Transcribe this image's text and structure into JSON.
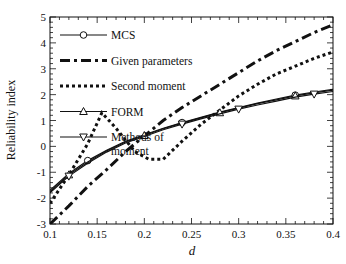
{
  "chart_data": {
    "type": "line",
    "title": "",
    "xlabel": "d",
    "ylabel": "Reliability index",
    "xlim": [
      0.1,
      0.4
    ],
    "ylim": [
      -3,
      5
    ],
    "xticks": [
      0.1,
      0.15,
      0.2,
      0.25,
      0.3,
      0.35,
      0.4
    ],
    "xtick_labels": [
      "0.1",
      "0.15",
      "0.2",
      "0.25",
      "0.3",
      "0.35",
      "0.4"
    ],
    "yticks": [
      -3,
      -2,
      -1,
      0,
      1,
      2,
      3,
      4,
      5
    ],
    "ytick_labels": [
      "-3",
      "-2",
      "-1",
      "0",
      "1",
      "2",
      "3",
      "4",
      "5"
    ],
    "grid": false,
    "legend_position": "top-left",
    "series": [
      {
        "name": "MCS",
        "style": "solid",
        "marker": "circle",
        "x": [
          0.1,
          0.12,
          0.14,
          0.16,
          0.18,
          0.2,
          0.22,
          0.24,
          0.26,
          0.28,
          0.3,
          0.32,
          0.34,
          0.36,
          0.38,
          0.4
        ],
        "y": [
          -1.7,
          -1.05,
          -0.55,
          -0.15,
          0.2,
          0.45,
          0.7,
          0.92,
          1.12,
          1.32,
          1.5,
          1.67,
          1.83,
          1.98,
          2.1,
          2.2
        ],
        "marker_x": [
          0.14,
          0.24,
          0.36
        ]
      },
      {
        "name": "Given parameters",
        "style": "dashdot",
        "marker": "none",
        "x": [
          0.1,
          0.12,
          0.14,
          0.16,
          0.18,
          0.2,
          0.22,
          0.24,
          0.26,
          0.28,
          0.3,
          0.32,
          0.34,
          0.36,
          0.38,
          0.4
        ],
        "y": [
          -3.0,
          -2.3,
          -1.55,
          -0.9,
          -0.2,
          0.4,
          1.0,
          1.5,
          1.95,
          2.4,
          2.85,
          3.3,
          3.7,
          4.05,
          4.4,
          4.7
        ]
      },
      {
        "name": "Second moment",
        "style": "dotted",
        "marker": "none",
        "x": [
          0.1,
          0.12,
          0.14,
          0.155,
          0.17,
          0.19,
          0.205,
          0.22,
          0.24,
          0.26,
          0.28,
          0.3,
          0.32,
          0.34,
          0.36,
          0.38,
          0.4
        ],
        "y": [
          -2.2,
          -1.1,
          0.1,
          1.3,
          0.7,
          -0.2,
          -0.5,
          -0.5,
          0.2,
          0.85,
          1.4,
          1.95,
          2.4,
          2.8,
          3.1,
          3.4,
          3.65
        ]
      },
      {
        "name": "FORM",
        "style": "solid",
        "marker": "triangle-up",
        "x": [
          0.1,
          0.12,
          0.14,
          0.16,
          0.18,
          0.2,
          0.22,
          0.24,
          0.26,
          0.28,
          0.3,
          0.32,
          0.34,
          0.36,
          0.38,
          0.4
        ],
        "y": [
          -1.75,
          -1.1,
          -0.6,
          -0.18,
          0.17,
          0.42,
          0.68,
          0.9,
          1.1,
          1.3,
          1.48,
          1.65,
          1.8,
          1.95,
          2.07,
          2.17
        ],
        "marker_x": [
          0.12,
          0.2,
          0.28,
          0.36
        ]
      },
      {
        "name": "Methods of\nmoment",
        "style": "solid",
        "marker": "triangle-down",
        "x": [
          0.1,
          0.12,
          0.14,
          0.16,
          0.18,
          0.2,
          0.22,
          0.24,
          0.26,
          0.28,
          0.3,
          0.32,
          0.34,
          0.36,
          0.38,
          0.4
        ],
        "y": [
          -1.8,
          -1.15,
          -0.65,
          -0.22,
          0.13,
          0.38,
          0.64,
          0.86,
          1.06,
          1.26,
          1.44,
          1.6,
          1.75,
          1.9,
          2.02,
          2.12
        ],
        "marker_x": [
          0.12,
          0.24,
          0.3,
          0.38
        ]
      }
    ]
  }
}
